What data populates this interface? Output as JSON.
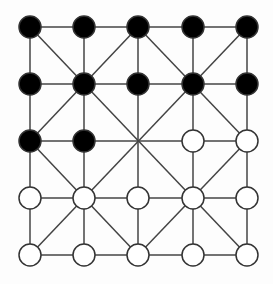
{
  "game": "Alquerque",
  "board": {
    "columns_x": [
      30,
      84,
      138,
      193,
      247
    ],
    "rows_y": [
      27,
      84,
      141,
      198,
      255
    ],
    "piece_radius": 11,
    "line_color": "#444444",
    "colors": {
      "black": "#000000",
      "white": "#ffffff"
    },
    "cells": [
      [
        "black",
        "black",
        "black",
        "black",
        "black"
      ],
      [
        "black",
        "black",
        "black",
        "black",
        "black"
      ],
      [
        "black",
        "black",
        "empty",
        "white",
        "white"
      ],
      [
        "white",
        "white",
        "white",
        "white",
        "white"
      ],
      [
        "white",
        "white",
        "white",
        "white",
        "white"
      ]
    ]
  }
}
